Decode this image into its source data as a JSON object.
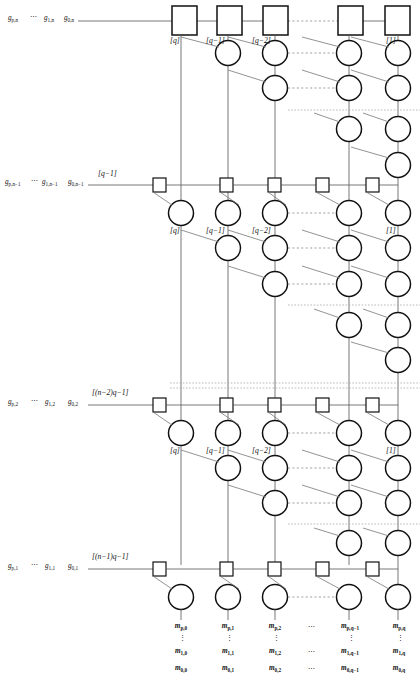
{
  "figure": {
    "type": "systolic-array-lattice-diagram",
    "colors": {
      "node_stroke": "#1a1a1a",
      "wire": "#555555",
      "dotted": "#888888",
      "background": "#ffffff"
    }
  },
  "bands": [
    {
      "id": "band-1",
      "bracket_label": "",
      "inputs": [
        "g",
        "⋯",
        "g",
        "g"
      ],
      "input_labels": [
        "g_{p,n}",
        "g_{1,n}",
        "g_{0,n}"
      ],
      "node_shape": "square-large",
      "column_labels": [
        "[q]",
        "[q−1]",
        "[q−2]",
        "",
        "[1]"
      ]
    },
    {
      "id": "band-2",
      "bracket_label": "[q−1]",
      "input_labels": [
        "g_{p,n−1}",
        "g_{1,n−1}",
        "g_{0,n−1}"
      ],
      "node_shape": "square-small",
      "column_labels": [
        "[q]",
        "[q−1]",
        "[q−2]",
        "",
        "[1]"
      ]
    },
    {
      "id": "band-3",
      "bracket_label": "[(n−2)q−1]",
      "input_labels": [
        "g_{p,2}",
        "g_{1,2}",
        "g_{0,2}"
      ],
      "node_shape": "square-small",
      "column_labels": [
        "[q]",
        "[q−1]",
        "[q−2]",
        "",
        "[1]"
      ]
    },
    {
      "id": "band-4",
      "bracket_label": "[(n−1)q−1]",
      "input_labels": [
        "g_{p,1}",
        "g_{1,1}",
        "g_{0,1}"
      ],
      "node_shape": "square-small",
      "column_labels": []
    }
  ],
  "left_labels": {
    "row1": {
      "a": "g",
      "a_sub": "p,n",
      "ell": "⋯",
      "b": "g",
      "b_sub": "1,n",
      "c": "g",
      "c_sub": "0,n"
    },
    "row2": {
      "a": "g",
      "a_sub": "p,n−1",
      "ell": "⋯",
      "b": "g",
      "b_sub": "1,n−1",
      "c": "g",
      "c_sub": "0,n−1"
    },
    "row3": {
      "a": "g",
      "a_sub": "p,2",
      "ell": "⋯",
      "b": "g",
      "b_sub": "1,2",
      "c": "g",
      "c_sub": "0,2"
    },
    "row4": {
      "a": "g",
      "a_sub": "p,1",
      "ell": "⋯",
      "b": "g",
      "b_sub": "1,1",
      "c": "g",
      "c_sub": "0,1"
    }
  },
  "brackets": {
    "band2": "[q−1]",
    "band3": "[(n−2)q−1]",
    "band4": "[(n−1)q−1]"
  },
  "column_brackets": {
    "c1": "[q]",
    "c2": "[q−1]",
    "c3": "[q−2]",
    "c5": "[1]"
  },
  "outputs": {
    "ellipsis": "⋯",
    "columns": [
      {
        "top": "m",
        "top_sub": "p,0",
        "mid": "m",
        "mid_sub": "1,0",
        "bot": "m",
        "bot_sub": "0,0"
      },
      {
        "top": "m",
        "top_sub": "p,1",
        "mid": "m",
        "mid_sub": "1,1",
        "bot": "m",
        "bot_sub": "0,1"
      },
      {
        "top": "m",
        "top_sub": "p,2",
        "mid": "m",
        "mid_sub": "1,2",
        "bot": "m",
        "bot_sub": "0,2"
      },
      {
        "top": "m",
        "top_sub": "p,q−1",
        "mid": "m",
        "mid_sub": "1,q−1",
        "bot": "m",
        "bot_sub": "0,q−1"
      },
      {
        "top": "m",
        "top_sub": "p,q",
        "mid": "m",
        "mid_sub": "1,q",
        "bot": "m",
        "bot_sub": "0,q"
      }
    ],
    "vdots": "⋮"
  }
}
